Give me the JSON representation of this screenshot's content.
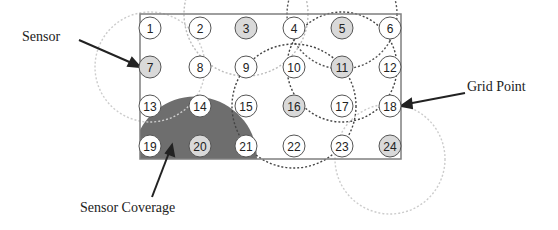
{
  "labels": {
    "sensor": "Sensor",
    "grid_point": "Grid Point",
    "sensor_coverage": "Sensor Coverage"
  },
  "grid": {
    "rows": 4,
    "cols": 6,
    "points": [
      {
        "id": "1",
        "sensor": false
      },
      {
        "id": "2",
        "sensor": false
      },
      {
        "id": "3",
        "sensor": true
      },
      {
        "id": "4",
        "sensor": false
      },
      {
        "id": "5",
        "sensor": true
      },
      {
        "id": "6",
        "sensor": false
      },
      {
        "id": "7",
        "sensor": true
      },
      {
        "id": "8",
        "sensor": false
      },
      {
        "id": "9",
        "sensor": false
      },
      {
        "id": "10",
        "sensor": false
      },
      {
        "id": "11",
        "sensor": true
      },
      {
        "id": "12",
        "sensor": false
      },
      {
        "id": "13",
        "sensor": false
      },
      {
        "id": "14",
        "sensor": false
      },
      {
        "id": "15",
        "sensor": false
      },
      {
        "id": "16",
        "sensor": true
      },
      {
        "id": "17",
        "sensor": false
      },
      {
        "id": "18",
        "sensor": false
      },
      {
        "id": "19",
        "sensor": false
      },
      {
        "id": "20",
        "sensor": true
      },
      {
        "id": "21",
        "sensor": false
      },
      {
        "id": "22",
        "sensor": false
      },
      {
        "id": "23",
        "sensor": false
      },
      {
        "id": "24",
        "sensor": true
      }
    ]
  },
  "colors": {
    "sensor_fill": "#d9d9d9",
    "grid_fill": "#ffffff",
    "coverage_fill": "#6e6e6e",
    "border": "#7f7f7f",
    "dotted": "#444444"
  }
}
